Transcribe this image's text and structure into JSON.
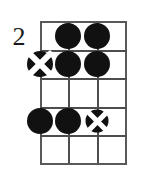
{
  "diagram": {
    "kind": "guitar-chord-diagram",
    "fret_position_label": "2",
    "strings": 4,
    "frets": 5,
    "colors": {
      "ink": "#111111",
      "grid": "#4d4d4d",
      "background": "#ffffff"
    },
    "marker_legend": {
      "filled": "fingered note",
      "muted": "fingered note with X overlay"
    },
    "markers": [
      {
        "name": "marker-fret1-string2",
        "string": 2,
        "fret": 1,
        "type": "filled"
      },
      {
        "name": "marker-fret1-string3",
        "string": 3,
        "fret": 1,
        "type": "filled"
      },
      {
        "name": "marker-fret2-string1",
        "string": 1,
        "fret": 2,
        "type": "muted"
      },
      {
        "name": "marker-fret2-string2",
        "string": 2,
        "fret": 2,
        "type": "filled"
      },
      {
        "name": "marker-fret2-string3",
        "string": 3,
        "fret": 2,
        "type": "filled"
      },
      {
        "name": "marker-fret4-string1",
        "string": 1,
        "fret": 4,
        "type": "filled"
      },
      {
        "name": "marker-fret4-string2",
        "string": 2,
        "fret": 4,
        "type": "filled"
      },
      {
        "name": "marker-fret4-string3",
        "string": 3,
        "fret": 4,
        "type": "muted-small"
      }
    ],
    "empty_frets": [
      3,
      5
    ]
  }
}
